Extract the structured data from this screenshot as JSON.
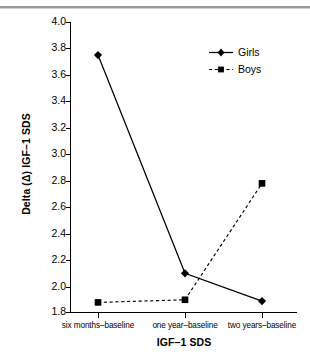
{
  "chart_data": {
    "type": "line",
    "title": "",
    "xlabel": "IGF–1 SDS",
    "ylabel": "Delta (Δ) IGF–1 SDS",
    "categories": [
      "six months–baseline",
      "one year–baseline",
      "two years–baseline"
    ],
    "series": [
      {
        "name": "Girls",
        "values": [
          3.75,
          2.1,
          1.89
        ],
        "linestyle": "solid",
        "marker": "diamond",
        "color": "#000000"
      },
      {
        "name": "Boys",
        "values": [
          1.88,
          1.9,
          2.78
        ],
        "linestyle": "dashed",
        "marker": "square",
        "color": "#000000"
      }
    ],
    "ylim": [
      1.8,
      4.0
    ],
    "ytick_step": 0.2,
    "ytick_labels": [
      "4.0",
      "3.8",
      "3.6",
      "3.4",
      "3.2",
      "3.0",
      "2.8",
      "2.6",
      "2.4",
      "2.2",
      "2.0",
      "1.8"
    ],
    "grid": false,
    "legend_position": "top-right"
  },
  "legend": {
    "items": [
      {
        "label": "Girls",
        "marker": "diamond-marker",
        "line": "solid-line"
      },
      {
        "label": "Boys",
        "marker": "square-marker",
        "line": "dashed-line"
      }
    ]
  }
}
